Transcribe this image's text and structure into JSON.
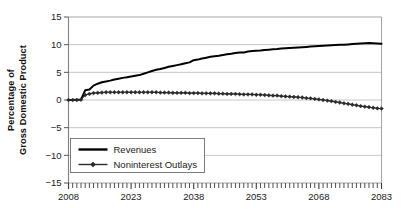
{
  "chart_data": {
    "type": "line",
    "title": "",
    "xlabel": "",
    "ylabel_line1": "Percentage of",
    "ylabel_line2": "Gross Domestic Product",
    "ylabel": "Percentage of Gross Domestic Product",
    "xlim": [
      2008,
      2083
    ],
    "ylim": [
      -15,
      15
    ],
    "ytick_values": [
      15,
      10,
      5,
      0,
      -5,
      -10,
      -15
    ],
    "ytick_labels": [
      "15",
      "10",
      "5",
      "0",
      "−5",
      "−10",
      "−15"
    ],
    "xtick_values": [
      2008,
      2023,
      2038,
      2053,
      2068,
      2083
    ],
    "xtick_labels": [
      "2008",
      "2023",
      "2038",
      "2053",
      "2068",
      "2083"
    ],
    "x_minor_tick_interval": 1,
    "grid": "horizontal",
    "grid_color": "#b8b8b8",
    "axis_color": "#808080",
    "legend_position": "lower-left-inside",
    "x": [
      2008,
      2009,
      2010,
      2011,
      2012,
      2013,
      2014,
      2015,
      2016,
      2017,
      2018,
      2019,
      2020,
      2021,
      2022,
      2023,
      2024,
      2025,
      2026,
      2027,
      2028,
      2029,
      2030,
      2031,
      2032,
      2033,
      2034,
      2035,
      2036,
      2037,
      2038,
      2039,
      2040,
      2041,
      2042,
      2043,
      2044,
      2045,
      2046,
      2047,
      2048,
      2049,
      2050,
      2051,
      2052,
      2053,
      2054,
      2055,
      2056,
      2057,
      2058,
      2059,
      2060,
      2061,
      2062,
      2063,
      2064,
      2065,
      2066,
      2067,
      2068,
      2069,
      2070,
      2071,
      2072,
      2073,
      2074,
      2075,
      2076,
      2077,
      2078,
      2079,
      2080,
      2081,
      2082,
      2083
    ],
    "series": [
      {
        "name": "Revenues",
        "color": "#000000",
        "marker": "none",
        "linewidth": 2.0,
        "values": [
          0.0,
          0.0,
          0.05,
          0.1,
          1.75,
          1.9,
          2.6,
          2.95,
          3.2,
          3.35,
          3.5,
          3.7,
          3.85,
          4.0,
          4.1,
          4.25,
          4.4,
          4.5,
          4.75,
          5.0,
          5.25,
          5.45,
          5.6,
          5.8,
          6.0,
          6.15,
          6.3,
          6.45,
          6.65,
          6.8,
          7.2,
          7.3,
          7.5,
          7.65,
          7.8,
          7.9,
          8.0,
          8.15,
          8.25,
          8.35,
          8.5,
          8.6,
          8.6,
          8.75,
          8.85,
          8.9,
          8.95,
          9.05,
          9.1,
          9.15,
          9.2,
          9.3,
          9.35,
          9.4,
          9.45,
          9.5,
          9.55,
          9.6,
          9.65,
          9.7,
          9.75,
          9.8,
          9.85,
          9.9,
          9.95,
          10.0,
          10.0,
          10.05,
          10.1,
          10.15,
          10.2,
          10.25,
          10.3,
          10.25,
          10.2,
          10.15
        ]
      },
      {
        "name": "Noninterest Outlays",
        "color": "#2b2b2b",
        "marker": "diamond",
        "linewidth": 1.2,
        "values": [
          0.0,
          0.0,
          0.0,
          0.05,
          0.9,
          1.1,
          1.25,
          1.3,
          1.35,
          1.4,
          1.4,
          1.4,
          1.4,
          1.4,
          1.4,
          1.4,
          1.4,
          1.4,
          1.4,
          1.4,
          1.4,
          1.4,
          1.35,
          1.35,
          1.35,
          1.3,
          1.3,
          1.3,
          1.3,
          1.25,
          1.25,
          1.25,
          1.2,
          1.2,
          1.2,
          1.2,
          1.15,
          1.15,
          1.1,
          1.1,
          1.1,
          1.05,
          1.0,
          1.0,
          1.0,
          0.95,
          0.95,
          0.9,
          0.85,
          0.8,
          0.8,
          0.7,
          0.65,
          0.6,
          0.55,
          0.5,
          0.45,
          0.35,
          0.3,
          0.2,
          0.1,
          0.0,
          -0.1,
          -0.2,
          -0.35,
          -0.45,
          -0.6,
          -0.7,
          -0.85,
          -0.95,
          -1.1,
          -1.2,
          -1.3,
          -1.4,
          -1.5,
          -1.55
        ]
      }
    ],
    "legend": [
      {
        "label": "Revenues",
        "style": "thick-line"
      },
      {
        "label": "Noninterest Outlays",
        "style": "line-with-diamond"
      }
    ]
  }
}
